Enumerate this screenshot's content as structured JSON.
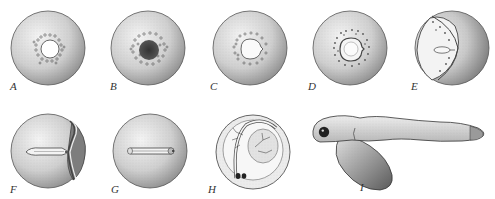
{
  "figure": {
    "labels": [
      "A",
      "B",
      "C",
      "D",
      "E",
      "F",
      "G",
      "H",
      "I"
    ],
    "panels": [
      {
        "id": "A",
        "label": "A",
        "depicts": "egg with blastodisc and oil droplets ring, clear center"
      },
      {
        "id": "B",
        "label": "B",
        "depicts": "egg with dark cleaving blastodisc surrounded by oil droplets"
      },
      {
        "id": "C",
        "label": "C",
        "depicts": "egg with blastoderm ring and droplets"
      },
      {
        "id": "D",
        "label": "D",
        "depicts": "egg with blastoderm disc outlined, droplets ring"
      },
      {
        "id": "E",
        "label": "E",
        "depicts": "egg with blastoderm spreading over yolk, embryonic shield"
      },
      {
        "id": "F",
        "label": "F",
        "depicts": "egg with elongating embryo along yolk"
      },
      {
        "id": "G",
        "label": "G",
        "depicts": "egg with embryo axis seen dorsally"
      },
      {
        "id": "H",
        "label": "H",
        "depicts": "egg with curled embryo, eyes and vascularized yolk"
      },
      {
        "id": "I",
        "label": "I",
        "depicts": "hatched larva with large yolk sac"
      }
    ]
  },
  "colors": {
    "ink": "#333333",
    "shade": "#8a8a8a",
    "light": "#e6e6e6",
    "background": "#ffffff"
  }
}
